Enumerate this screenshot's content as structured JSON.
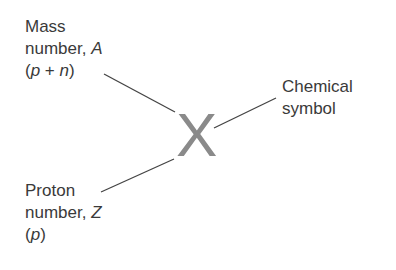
{
  "diagram": {
    "symbol": "X",
    "mass_number": {
      "line1": "Mass",
      "line2_prefix": "number, ",
      "line2_var": "A",
      "line3_open": "(",
      "line3_p": "p",
      "line3_plus": " + ",
      "line3_n": "n",
      "line3_close": ")"
    },
    "chemical_symbol": {
      "line1": "Chemical",
      "line2": "symbol"
    },
    "proton_number": {
      "line1": "Proton",
      "line2_prefix": "number, ",
      "line2_var": "Z",
      "line3_open": "(",
      "line3_p": "p",
      "line3_close": ")"
    },
    "colors": {
      "text": "#3a3a3a",
      "symbol": "#8a8a8a",
      "line": "#444444"
    }
  }
}
